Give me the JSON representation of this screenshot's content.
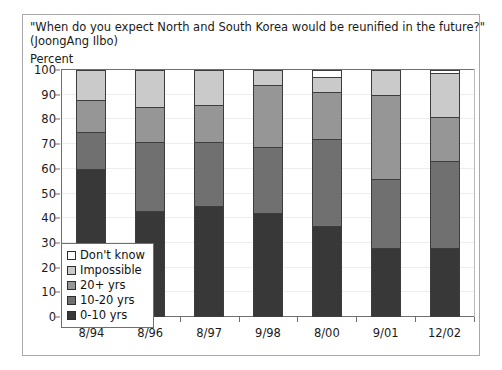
{
  "title": {
    "line1": "\"When do you expect North and South Korea would be reunified in the future?\"",
    "line2": "(JoongAng Ilbo)"
  },
  "axis_unit_label": "Percent",
  "legend": {
    "items": [
      {
        "label": "Don't know",
        "color": "#ffffff"
      },
      {
        "label": "Impossible",
        "color": "#cacaca"
      },
      {
        "label": "20+ yrs",
        "color": "#969696"
      },
      {
        "label": "10-20 yrs",
        "color": "#707070"
      },
      {
        "label": "0-10 yrs",
        "color": "#383838"
      }
    ]
  },
  "chart_data": {
    "type": "bar",
    "stacked": true,
    "title": "\"When do you expect North and South Korea would be reunified in the future?\" (JoongAng Ilbo)",
    "xlabel": "",
    "ylabel": "Percent",
    "ylim": [
      0,
      100
    ],
    "yticks": [
      0,
      10,
      20,
      30,
      40,
      50,
      60,
      70,
      80,
      90,
      100
    ],
    "grid": true,
    "legend_position": "inside-lower-left",
    "categories": [
      "8/94",
      "8/96",
      "8/97",
      "9/98",
      "8/00",
      "9/01",
      "12/02"
    ],
    "series": [
      {
        "name": "0-10 yrs",
        "color": "#383838",
        "values": [
          60,
          43,
          45,
          42,
          37,
          28,
          28
        ]
      },
      {
        "name": "10-20 yrs",
        "color": "#707070",
        "values": [
          15,
          28,
          26,
          27,
          35,
          28,
          35
        ]
      },
      {
        "name": "20+ yrs",
        "color": "#969696",
        "values": [
          13,
          14,
          15,
          25,
          19,
          34,
          18
        ]
      },
      {
        "name": "Impossible",
        "color": "#cacaca",
        "values": [
          12,
          15,
          14,
          6,
          6,
          10,
          18
        ]
      },
      {
        "name": "Don't know",
        "color": "#ffffff",
        "values": [
          0,
          0,
          0,
          0,
          3,
          0,
          1
        ]
      }
    ]
  }
}
